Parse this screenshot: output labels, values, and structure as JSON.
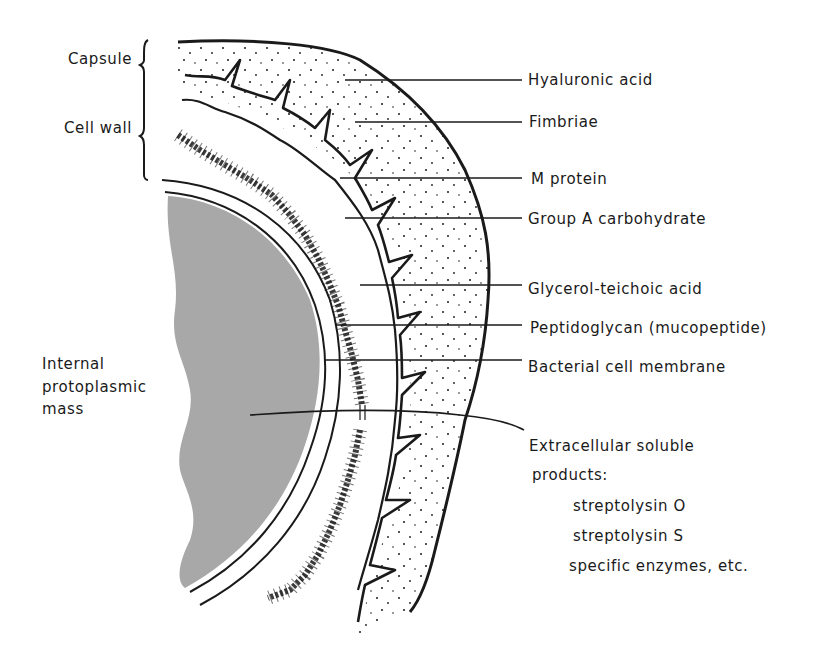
{
  "figure": {
    "left_labels": {
      "capsule": "Capsule",
      "cell_wall": "Cell wall",
      "internal_line1": "Internal",
      "internal_line2": "protoplasmic",
      "internal_line3": "mass"
    },
    "right_labels": [
      {
        "text": "Hyaluronic acid"
      },
      {
        "text": "Fimbriae"
      },
      {
        "text": "M protein"
      },
      {
        "text": "Group A carbohydrate"
      },
      {
        "text": "Glycerol-teichoic acid"
      },
      {
        "text": "Peptidoglycan (mucopeptide)"
      },
      {
        "text": "Bacterial cell membrane"
      }
    ],
    "extracellular": {
      "heading_line1": "Extracellular soluble",
      "heading_line2": "products:",
      "items": [
        "streptolysin O",
        "streptolysin S",
        "specific enzymes, etc."
      ]
    },
    "colors": {
      "ink": "#1a1a1a",
      "protoplasm": "#a8a8a8",
      "background": "#ffffff"
    }
  }
}
